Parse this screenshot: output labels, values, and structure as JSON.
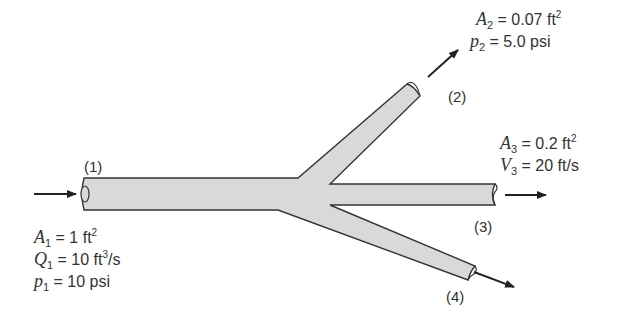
{
  "diagram": {
    "type": "pipe-branching-flow",
    "pipe_fill": "#d9d9d9",
    "pipe_stroke": "#333333",
    "sections": [
      {
        "id": "1",
        "label": "(1)"
      },
      {
        "id": "2",
        "label": "(2)"
      },
      {
        "id": "3",
        "label": "(3)"
      },
      {
        "id": "4",
        "label": "(4)"
      }
    ],
    "section1": {
      "rows": [
        {
          "var": "A",
          "sub": "1",
          "eq": " = 1 ft",
          "sup": "2",
          "tail": ""
        },
        {
          "var": "Q",
          "sub": "1",
          "eq": " = 10 ft",
          "sup": "3",
          "tail": "/s"
        },
        {
          "var": "p",
          "sub": "1",
          "eq": " = 10 psi",
          "sup": "",
          "tail": ""
        }
      ]
    },
    "section2": {
      "rows": [
        {
          "var": "A",
          "sub": "2",
          "eq": " = 0.07 ft",
          "sup": "2",
          "tail": ""
        },
        {
          "var": "p",
          "sub": "2",
          "eq": " = 5.0 psi",
          "sup": "",
          "tail": ""
        }
      ]
    },
    "section3": {
      "rows": [
        {
          "var": "A",
          "sub": "3",
          "eq": " = 0.2 ft",
          "sup": "2",
          "tail": ""
        },
        {
          "var": "V",
          "sub": "3",
          "eq": " = 20 ft/s",
          "sup": "",
          "tail": ""
        }
      ]
    }
  }
}
